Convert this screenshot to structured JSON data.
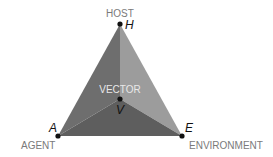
{
  "diagram": {
    "vertices": {
      "host": {
        "label": "HOST",
        "letter": "H"
      },
      "agent": {
        "label": "AGENT",
        "letter": "A"
      },
      "environment": {
        "label": "ENVIRONMENT",
        "letter": "E"
      },
      "vector": {
        "label": "VECTOR",
        "letter": "V"
      }
    },
    "colors": {
      "left_face": "#6d6d6d",
      "right_face": "#9a9a9a",
      "bottom_face": "#5c5c5c",
      "point": "#111111",
      "label": "#7a7a7a"
    }
  }
}
